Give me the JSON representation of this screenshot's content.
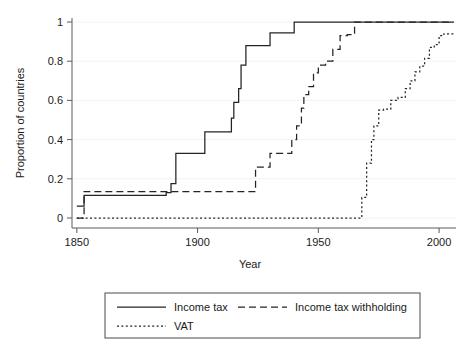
{
  "chart_data": {
    "type": "line",
    "title": "",
    "xlabel": "Year",
    "ylabel": "Proportion of countries",
    "xlim": [
      1848,
      2007
    ],
    "ylim": [
      -0.02,
      1.02
    ],
    "grid": true,
    "legend_position": "below",
    "xticks": [
      1850,
      1900,
      1950,
      2000
    ],
    "xtick_labels": [
      "1850",
      "1900",
      "1950",
      "2000"
    ],
    "yticks": [
      0,
      0.2,
      0.4,
      0.6,
      0.8,
      1
    ],
    "ytick_labels": [
      "0",
      "0.2",
      "0.4",
      "0.6",
      "0.8",
      "1"
    ],
    "interpolation": "step-post",
    "series": [
      {
        "name": "Income tax",
        "style": "solid",
        "x": [
          1850,
          1852,
          1853,
          1885,
          1887,
          1889,
          1891,
          1900,
          1903,
          1911,
          1914,
          1915,
          1917,
          1918,
          1920,
          1921,
          1923,
          1930,
          1932,
          1940,
          2006
        ],
        "values": [
          0.06,
          0.06,
          0.115,
          0.115,
          0.13,
          0.175,
          0.33,
          0.33,
          0.44,
          0.44,
          0.51,
          0.59,
          0.66,
          0.78,
          0.88,
          0.88,
          0.88,
          0.945,
          0.945,
          1.0,
          1.0
        ]
      },
      {
        "name": "Income tax withholding",
        "style": "dashed",
        "x": [
          1850,
          1852,
          1853,
          1922,
          1924,
          1926,
          1930,
          1932,
          1937,
          1939,
          1941,
          1943,
          1944,
          1946,
          1948,
          1950,
          1953,
          1956,
          1959,
          1962,
          1965,
          2006
        ],
        "values": [
          0.0,
          0.0,
          0.135,
          0.135,
          0.26,
          0.26,
          0.33,
          0.33,
          0.33,
          0.4,
          0.47,
          0.56,
          0.63,
          0.67,
          0.74,
          0.78,
          0.8,
          0.86,
          0.93,
          0.935,
          1.0,
          1.0
        ]
      },
      {
        "name": "VAT",
        "style": "dotted",
        "x": [
          1850,
          1966,
          1968,
          1970,
          1972,
          1973,
          1975,
          1977,
          1980,
          1983,
          1986,
          1988,
          1990,
          1992,
          1994,
          1996,
          1998,
          2000,
          2002,
          2006
        ],
        "values": [
          0.0,
          0.0,
          0.105,
          0.28,
          0.4,
          0.47,
          0.55,
          0.555,
          0.6,
          0.615,
          0.66,
          0.7,
          0.745,
          0.775,
          0.815,
          0.87,
          0.885,
          0.93,
          0.94,
          0.94
        ]
      }
    ]
  },
  "legend": {
    "entries": [
      {
        "label": "Income tax",
        "style": "solid"
      },
      {
        "label": "Income tax withholding",
        "style": "dashed"
      },
      {
        "label": "VAT",
        "style": "dotted"
      }
    ]
  }
}
